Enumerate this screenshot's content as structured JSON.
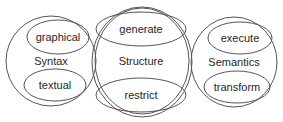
{
  "diagram": {
    "groups": [
      {
        "label": "Syntax",
        "items": [
          {
            "label": "graphical"
          },
          {
            "label": "textual"
          }
        ]
      },
      {
        "label": "Structure",
        "items": [
          {
            "label": "generate"
          },
          {
            "label": "restrict"
          }
        ]
      },
      {
        "label": "Semantics",
        "items": [
          {
            "label": "execute"
          },
          {
            "label": "transform"
          }
        ]
      }
    ],
    "colors": {
      "stroke": "#555555",
      "text": "#262626",
      "background": "#ffffff"
    }
  }
}
